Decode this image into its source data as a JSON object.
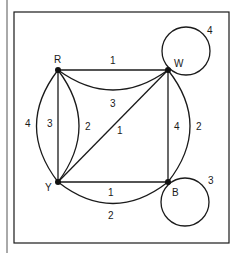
{
  "diagram": {
    "type": "multigraph",
    "vertices": [
      {
        "id": "R",
        "label": "R"
      },
      {
        "id": "W",
        "label": "W"
      },
      {
        "id": "Y",
        "label": "Y"
      },
      {
        "id": "B",
        "label": "B"
      }
    ],
    "edges": [
      {
        "from": "R",
        "to": "W",
        "weight": "1",
        "shape": "straight"
      },
      {
        "from": "R",
        "to": "W",
        "weight": "3",
        "shape": "curve"
      },
      {
        "from": "R",
        "to": "Y",
        "weight": "3",
        "shape": "straight"
      },
      {
        "from": "R",
        "to": "Y",
        "weight": "4",
        "shape": "outer-arc"
      },
      {
        "from": "R",
        "to": "Y",
        "weight": "2",
        "shape": "inner-arc"
      },
      {
        "from": "Y",
        "to": "W",
        "weight": "1",
        "shape": "diagonal"
      },
      {
        "from": "W",
        "to": "B",
        "weight": "4",
        "shape": "straight"
      },
      {
        "from": "W",
        "to": "B",
        "weight": "2",
        "shape": "outer-arc"
      },
      {
        "from": "Y",
        "to": "B",
        "weight": "1",
        "shape": "straight"
      },
      {
        "from": "Y",
        "to": "B",
        "weight": "2",
        "shape": "lower-arc"
      },
      {
        "from": "W",
        "to": "W",
        "weight": "4",
        "shape": "loop"
      },
      {
        "from": "B",
        "to": "B",
        "weight": "3",
        "shape": "loop"
      }
    ],
    "labels": {
      "R": "R",
      "W": "W",
      "Y": "Y",
      "B": "B",
      "rw_straight": "1",
      "rw_curve": "3",
      "ry_outer": "4",
      "ry_straight": "3",
      "ry_inner": "2",
      "yw_diag": "1",
      "wb_straight": "4",
      "wb_outer": "2",
      "yb_straight": "1",
      "yb_arc": "2",
      "w_loop": "4",
      "b_loop": "3"
    }
  }
}
